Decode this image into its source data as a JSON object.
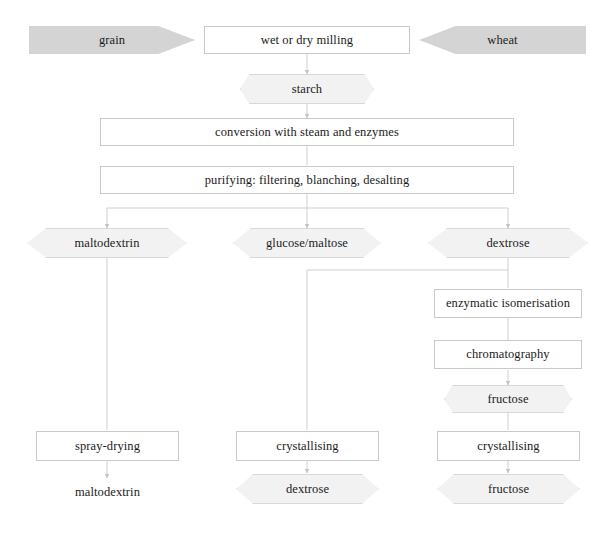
{
  "diagram": {
    "colors": {
      "feed_fill": "#d4d4d4",
      "hex_fill": "#f2f2f2",
      "box_fill": "#ffffff",
      "border": "#c9c9c9",
      "connector": "#cccccc",
      "text": "#1a1a1a"
    },
    "nodes": {
      "grain": "grain",
      "wheat": "wheat",
      "milling": "wet or dry milling",
      "starch": "starch",
      "conversion": "conversion with steam and enzymes",
      "purifying": "purifying: filtering, blanching, desalting",
      "maltodextrin": "maltodextrin",
      "glucose_maltose": "glucose/maltose",
      "dextrose": "dextrose",
      "isomerisation": "enzymatic isomerisation",
      "chromatography": "chromatography",
      "fructose_mid": "fructose",
      "spray_drying": "spray-drying",
      "crystallising_mid": "crystallising",
      "crystallising_right": "crystallising",
      "maltodextrin_out": "maltodextrin",
      "dextrose_out": "dextrose",
      "fructose_out": "fructose"
    },
    "flow_edges": [
      {
        "from": "grain",
        "to": "milling"
      },
      {
        "from": "wheat",
        "to": "milling"
      },
      {
        "from": "milling",
        "to": "starch"
      },
      {
        "from": "starch",
        "to": "conversion"
      },
      {
        "from": "conversion",
        "to": "purifying"
      },
      {
        "from": "purifying",
        "to": "maltodextrin"
      },
      {
        "from": "purifying",
        "to": "glucose_maltose"
      },
      {
        "from": "purifying",
        "to": "dextrose"
      },
      {
        "from": "maltodextrin",
        "to": "spray_drying"
      },
      {
        "from": "spray_drying",
        "to": "maltodextrin_out"
      },
      {
        "from": "dextrose",
        "to": "crystallising_mid"
      },
      {
        "from": "crystallising_mid",
        "to": "dextrose_out"
      },
      {
        "from": "dextrose",
        "to": "isomerisation"
      },
      {
        "from": "isomerisation",
        "to": "chromatography"
      },
      {
        "from": "chromatography",
        "to": "fructose_mid"
      },
      {
        "from": "fructose_mid",
        "to": "crystallising_right"
      },
      {
        "from": "crystallising_right",
        "to": "fructose_out"
      }
    ]
  }
}
